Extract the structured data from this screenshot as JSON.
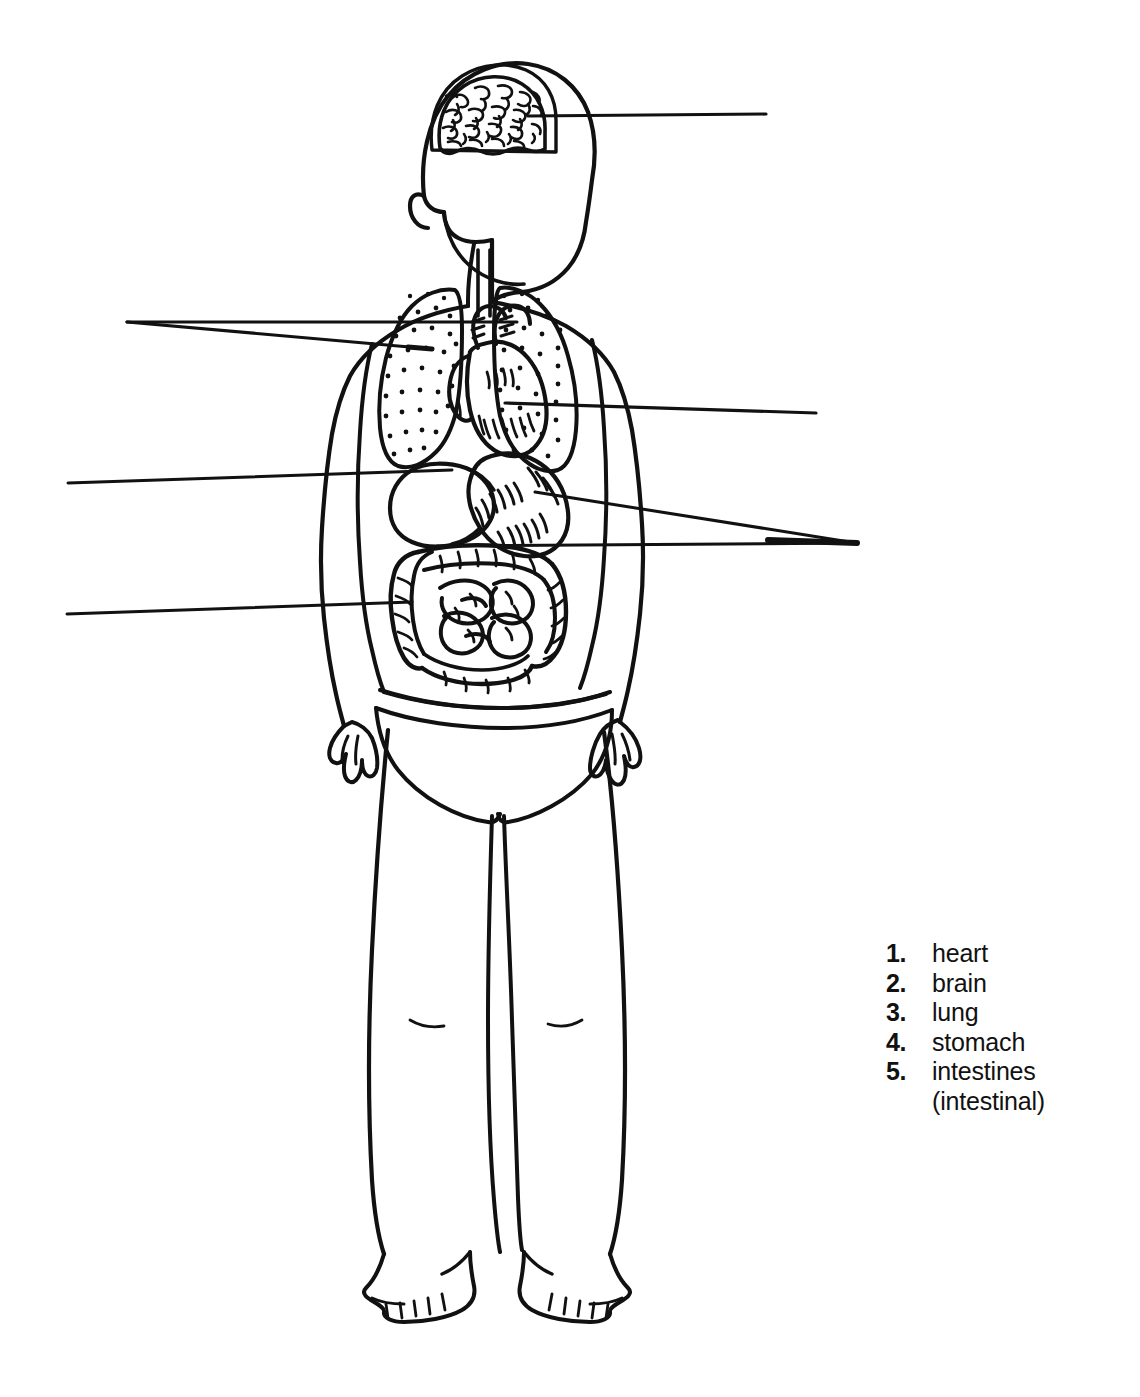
{
  "figure": {
    "stroke_color": "#111111",
    "background_color": "#ffffff"
  },
  "legend": {
    "items": [
      {
        "number": "1.",
        "label": "heart"
      },
      {
        "number": "2.",
        "label": "brain"
      },
      {
        "number": "3.",
        "label": "lung"
      },
      {
        "number": "4.",
        "label": "stomach"
      },
      {
        "number": "5.",
        "label": "intestines",
        "sublabel": "(intestinal)"
      }
    ]
  },
  "organs": [
    {
      "name": "brain",
      "region": "head"
    },
    {
      "name": "lung-left",
      "region": "thorax"
    },
    {
      "name": "lung-right",
      "region": "thorax"
    },
    {
      "name": "heart",
      "region": "thorax"
    },
    {
      "name": "liver",
      "region": "abdomen"
    },
    {
      "name": "stomach",
      "region": "abdomen"
    },
    {
      "name": "intestines",
      "region": "abdomen"
    }
  ],
  "leader_lines": [
    {
      "name": "brain-leader",
      "side": "right"
    },
    {
      "name": "trachea-leader",
      "side": "left"
    },
    {
      "name": "lung-leader",
      "side": "left"
    },
    {
      "name": "liver-leader",
      "side": "left"
    },
    {
      "name": "intestines-leader-left",
      "side": "left"
    },
    {
      "name": "heart-leader",
      "side": "right"
    },
    {
      "name": "stomach-leader",
      "side": "right"
    },
    {
      "name": "intestines-leader-right",
      "side": "right"
    }
  ]
}
